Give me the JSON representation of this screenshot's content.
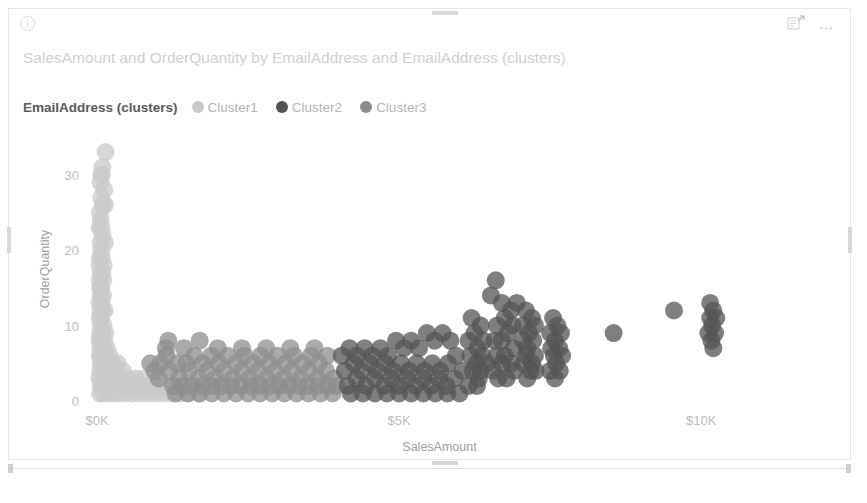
{
  "visual": {
    "title": "SalesAmount and OrderQuantity by EmailAddress and EmailAddress (clusters)",
    "info_icon": "info-circle-icon",
    "focus_icon": "focus-mode-icon",
    "more_icon": "…"
  },
  "legend": {
    "title": "EmailAddress (clusters)",
    "items": [
      {
        "label": "Cluster1",
        "color": "#c9c9c9"
      },
      {
        "label": "Cluster2",
        "color": "#545454"
      },
      {
        "label": "Cluster3",
        "color": "#8d8d8d"
      }
    ]
  },
  "chart_data": {
    "type": "scatter",
    "title": "SalesAmount and OrderQuantity by EmailAddress and EmailAddress (clusters)",
    "xlabel": "SalesAmount",
    "ylabel": "OrderQuantity",
    "xlim": [
      0,
      12000
    ],
    "ylim": [
      0,
      35
    ],
    "xticks": [
      0,
      5000,
      10000
    ],
    "xticklabels": [
      "$0K",
      "$5K",
      "$10K"
    ],
    "yticks": [
      0,
      10,
      20,
      30
    ],
    "yticklabels": [
      "0",
      "10",
      "20",
      "30"
    ],
    "grid": false,
    "legend_position": "top-left",
    "marker_radius": 9,
    "marker_opacity": 0.75,
    "series": [
      {
        "name": "Cluster1",
        "color": "#c9c9c9",
        "points": [
          [
            140,
            33
          ],
          [
            90,
            31
          ],
          [
            70,
            30
          ],
          [
            60,
            29
          ],
          [
            120,
            28
          ],
          [
            70,
            27
          ],
          [
            130,
            26
          ],
          [
            50,
            25
          ],
          [
            60,
            24
          ],
          [
            40,
            23
          ],
          [
            90,
            22
          ],
          [
            60,
            21
          ],
          [
            130,
            21
          ],
          [
            70,
            20
          ],
          [
            50,
            19
          ],
          [
            80,
            19
          ],
          [
            40,
            18
          ],
          [
            60,
            17
          ],
          [
            90,
            17
          ],
          [
            45,
            16
          ],
          [
            70,
            15
          ],
          [
            50,
            15
          ],
          [
            100,
            14
          ],
          [
            60,
            14
          ],
          [
            40,
            13
          ],
          [
            80,
            13
          ],
          [
            55,
            12
          ],
          [
            95,
            12
          ],
          [
            45,
            11
          ],
          [
            70,
            11
          ],
          [
            60,
            10
          ],
          [
            110,
            10
          ],
          [
            50,
            9
          ],
          [
            85,
            9
          ],
          [
            40,
            8
          ],
          [
            65,
            8
          ],
          [
            120,
            8
          ],
          [
            55,
            7
          ],
          [
            95,
            7
          ],
          [
            160,
            7
          ],
          [
            45,
            6
          ],
          [
            75,
            6
          ],
          [
            130,
            6
          ],
          [
            210,
            6
          ],
          [
            60,
            5
          ],
          [
            100,
            5
          ],
          [
            180,
            5
          ],
          [
            260,
            5
          ],
          [
            340,
            5
          ],
          [
            50,
            4
          ],
          [
            90,
            4
          ],
          [
            150,
            4
          ],
          [
            240,
            4
          ],
          [
            330,
            4
          ],
          [
            430,
            4
          ],
          [
            40,
            3
          ],
          [
            80,
            3
          ],
          [
            140,
            3
          ],
          [
            220,
            3
          ],
          [
            310,
            3
          ],
          [
            410,
            3
          ],
          [
            520,
            3
          ],
          [
            640,
            3
          ],
          [
            760,
            3
          ],
          [
            60,
            2
          ],
          [
            110,
            2
          ],
          [
            190,
            2
          ],
          [
            280,
            2
          ],
          [
            380,
            2
          ],
          [
            490,
            2
          ],
          [
            600,
            2
          ],
          [
            720,
            2
          ],
          [
            850,
            2
          ],
          [
            980,
            2
          ],
          [
            1120,
            2
          ],
          [
            50,
            1
          ],
          [
            100,
            1
          ],
          [
            170,
            1
          ],
          [
            250,
            1
          ],
          [
            350,
            1
          ],
          [
            460,
            1
          ],
          [
            580,
            1
          ],
          [
            700,
            1
          ],
          [
            830,
            1
          ],
          [
            960,
            1
          ],
          [
            1090,
            1
          ],
          [
            1230,
            1
          ],
          [
            1380,
            1
          ],
          [
            1520,
            1
          ],
          [
            1680,
            1
          ],
          [
            70,
            6
          ],
          [
            85,
            5
          ],
          [
            115,
            4
          ],
          [
            135,
            9
          ],
          [
            105,
            16
          ],
          [
            75,
            23
          ],
          [
            95,
            26
          ],
          [
            110,
            18
          ],
          [
            125,
            12
          ],
          [
            80,
            30
          ]
        ]
      },
      {
        "name": "Cluster3",
        "color": "#8d8d8d",
        "points": [
          [
            1150,
            6
          ],
          [
            1320,
            5
          ],
          [
            1480,
            5
          ],
          [
            1610,
            6
          ],
          [
            1750,
            5
          ],
          [
            1890,
            6
          ],
          [
            2020,
            5
          ],
          [
            2160,
            6
          ],
          [
            2300,
            5
          ],
          [
            2440,
            6
          ],
          [
            2580,
            5
          ],
          [
            2710,
            6
          ],
          [
            2850,
            5
          ],
          [
            2990,
            6
          ],
          [
            3120,
            5
          ],
          [
            3260,
            6
          ],
          [
            3400,
            5
          ],
          [
            3540,
            6
          ],
          [
            3670,
            5
          ],
          [
            3810,
            6
          ],
          [
            1200,
            4
          ],
          [
            1360,
            3
          ],
          [
            1520,
            4
          ],
          [
            1680,
            3
          ],
          [
            1820,
            4
          ],
          [
            1960,
            3
          ],
          [
            2100,
            4
          ],
          [
            2250,
            3
          ],
          [
            2390,
            4
          ],
          [
            2530,
            3
          ],
          [
            2670,
            4
          ],
          [
            2810,
            3
          ],
          [
            2950,
            4
          ],
          [
            3090,
            3
          ],
          [
            3230,
            4
          ],
          [
            3370,
            3
          ],
          [
            3510,
            4
          ],
          [
            3650,
            3
          ],
          [
            3790,
            4
          ],
          [
            3920,
            3
          ],
          [
            1260,
            2
          ],
          [
            1420,
            2
          ],
          [
            1580,
            2
          ],
          [
            1740,
            2
          ],
          [
            1900,
            2
          ],
          [
            2060,
            2
          ],
          [
            2220,
            2
          ],
          [
            2380,
            2
          ],
          [
            2540,
            2
          ],
          [
            2700,
            2
          ],
          [
            2860,
            2
          ],
          [
            3020,
            2
          ],
          [
            3180,
            2
          ],
          [
            3340,
            2
          ],
          [
            3500,
            2
          ],
          [
            3660,
            2
          ],
          [
            3820,
            2
          ],
          [
            3960,
            2
          ],
          [
            1300,
            1
          ],
          [
            1500,
            1
          ],
          [
            1700,
            1
          ],
          [
            1900,
            1
          ],
          [
            2100,
            1
          ],
          [
            2300,
            1
          ],
          [
            2500,
            1
          ],
          [
            2700,
            1
          ],
          [
            2900,
            1
          ],
          [
            3100,
            1
          ],
          [
            3300,
            1
          ],
          [
            3500,
            1
          ],
          [
            3700,
            1
          ],
          [
            3900,
            1
          ],
          [
            1140,
            7
          ],
          [
            1440,
            7
          ],
          [
            1700,
            8
          ],
          [
            2000,
            7
          ],
          [
            2400,
            7
          ],
          [
            2800,
            7
          ],
          [
            3200,
            7
          ],
          [
            3600,
            7
          ],
          [
            1050,
            5
          ],
          [
            950,
            4
          ],
          [
            880,
            5
          ],
          [
            1020,
            3
          ],
          [
            1180,
            8
          ]
        ]
      },
      {
        "name": "Cluster2",
        "color": "#545454",
        "points": [
          [
            4050,
            6
          ],
          [
            4180,
            7
          ],
          [
            4300,
            6
          ],
          [
            4430,
            7
          ],
          [
            4560,
            6
          ],
          [
            4690,
            7
          ],
          [
            4820,
            6
          ],
          [
            4950,
            8
          ],
          [
            5080,
            7
          ],
          [
            5200,
            8
          ],
          [
            5330,
            7
          ],
          [
            5460,
            9
          ],
          [
            5590,
            8
          ],
          [
            5720,
            9
          ],
          [
            5850,
            8
          ],
          [
            4100,
            4
          ],
          [
            4250,
            5
          ],
          [
            4380,
            4
          ],
          [
            4510,
            5
          ],
          [
            4640,
            4
          ],
          [
            4770,
            5
          ],
          [
            4900,
            4
          ],
          [
            5030,
            5
          ],
          [
            5160,
            4
          ],
          [
            5290,
            5
          ],
          [
            5420,
            4
          ],
          [
            5550,
            5
          ],
          [
            5680,
            4
          ],
          [
            5810,
            5
          ],
          [
            5940,
            6
          ],
          [
            4150,
            2
          ],
          [
            4300,
            3
          ],
          [
            4450,
            2
          ],
          [
            4600,
            3
          ],
          [
            4750,
            2
          ],
          [
            4880,
            3
          ],
          [
            5010,
            2
          ],
          [
            5140,
            3
          ],
          [
            5270,
            2
          ],
          [
            5400,
            3
          ],
          [
            5530,
            2
          ],
          [
            5660,
            3
          ],
          [
            5790,
            2
          ],
          [
            5920,
            3
          ],
          [
            6050,
            4
          ],
          [
            4200,
            1
          ],
          [
            4400,
            1
          ],
          [
            4600,
            1
          ],
          [
            4800,
            1
          ],
          [
            5000,
            1
          ],
          [
            5200,
            1
          ],
          [
            5400,
            1
          ],
          [
            5600,
            1
          ],
          [
            5800,
            1
          ],
          [
            6000,
            1
          ],
          [
            6150,
            8
          ],
          [
            6250,
            9
          ],
          [
            6350,
            10
          ],
          [
            6200,
            11
          ],
          [
            6300,
            7
          ],
          [
            6180,
            6
          ],
          [
            6280,
            5
          ],
          [
            6380,
            6
          ],
          [
            6220,
            4
          ],
          [
            6320,
            3
          ],
          [
            6150,
            2
          ],
          [
            6290,
            2
          ],
          [
            6400,
            8
          ],
          [
            6450,
            5
          ],
          [
            6350,
            4
          ],
          [
            6600,
            16
          ],
          [
            6520,
            14
          ],
          [
            6700,
            13
          ],
          [
            6850,
            12
          ],
          [
            6950,
            13
          ],
          [
            6750,
            11
          ],
          [
            6880,
            10
          ],
          [
            6620,
            10
          ],
          [
            6800,
            9
          ],
          [
            6700,
            8
          ],
          [
            6580,
            8
          ],
          [
            6900,
            7
          ],
          [
            6750,
            6
          ],
          [
            6620,
            6
          ],
          [
            6850,
            5
          ],
          [
            6700,
            5
          ],
          [
            6560,
            4
          ],
          [
            6900,
            4
          ],
          [
            6780,
            3
          ],
          [
            6640,
            3
          ],
          [
            7100,
            12
          ],
          [
            7200,
            11
          ],
          [
            7050,
            10
          ],
          [
            7250,
            10
          ],
          [
            7150,
            9
          ],
          [
            7050,
            8
          ],
          [
            7220,
            8
          ],
          [
            7120,
            7
          ],
          [
            7250,
            6
          ],
          [
            7100,
            6
          ],
          [
            7200,
            5
          ],
          [
            7060,
            5
          ],
          [
            7180,
            4
          ],
          [
            7260,
            4
          ],
          [
            7120,
            3
          ],
          [
            7550,
            11
          ],
          [
            7620,
            10
          ],
          [
            7500,
            9
          ],
          [
            7680,
            9
          ],
          [
            7580,
            8
          ],
          [
            7520,
            7
          ],
          [
            7650,
            7
          ],
          [
            7560,
            6
          ],
          [
            7700,
            6
          ],
          [
            7600,
            5
          ],
          [
            7500,
            4
          ],
          [
            7660,
            4
          ],
          [
            7580,
            3
          ],
          [
            8550,
            9
          ],
          [
            9550,
            12
          ],
          [
            10150,
            13
          ],
          [
            10200,
            12
          ],
          [
            10150,
            11
          ],
          [
            10250,
            11
          ],
          [
            10180,
            10
          ],
          [
            10120,
            9
          ],
          [
            10230,
            9
          ],
          [
            10170,
            8
          ],
          [
            10200,
            7
          ]
        ]
      }
    ]
  }
}
